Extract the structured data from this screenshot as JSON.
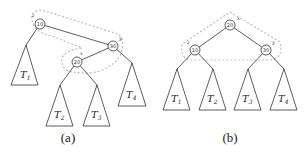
{
  "figure": {
    "panel_a": {
      "caption": "(a)",
      "nodes": [
        {
          "name": "z",
          "key": "10"
        },
        {
          "name": "y",
          "key": "30"
        },
        {
          "name": "x",
          "key": "20"
        }
      ],
      "subtrees": [
        {
          "label": "T",
          "sub": "1"
        },
        {
          "label": "T",
          "sub": "2"
        },
        {
          "label": "T",
          "sub": "3"
        },
        {
          "label": "T",
          "sub": "4"
        }
      ]
    },
    "panel_b": {
      "caption": "(b)",
      "nodes": [
        {
          "name": "x",
          "key": "20"
        },
        {
          "name": "z",
          "key": "10"
        },
        {
          "name": "y",
          "key": "30"
        }
      ],
      "subtrees": [
        {
          "label": "T",
          "sub": "1"
        },
        {
          "label": "T",
          "sub": "2"
        },
        {
          "label": "T",
          "sub": "3"
        },
        {
          "label": "T",
          "sub": "4"
        }
      ]
    }
  }
}
